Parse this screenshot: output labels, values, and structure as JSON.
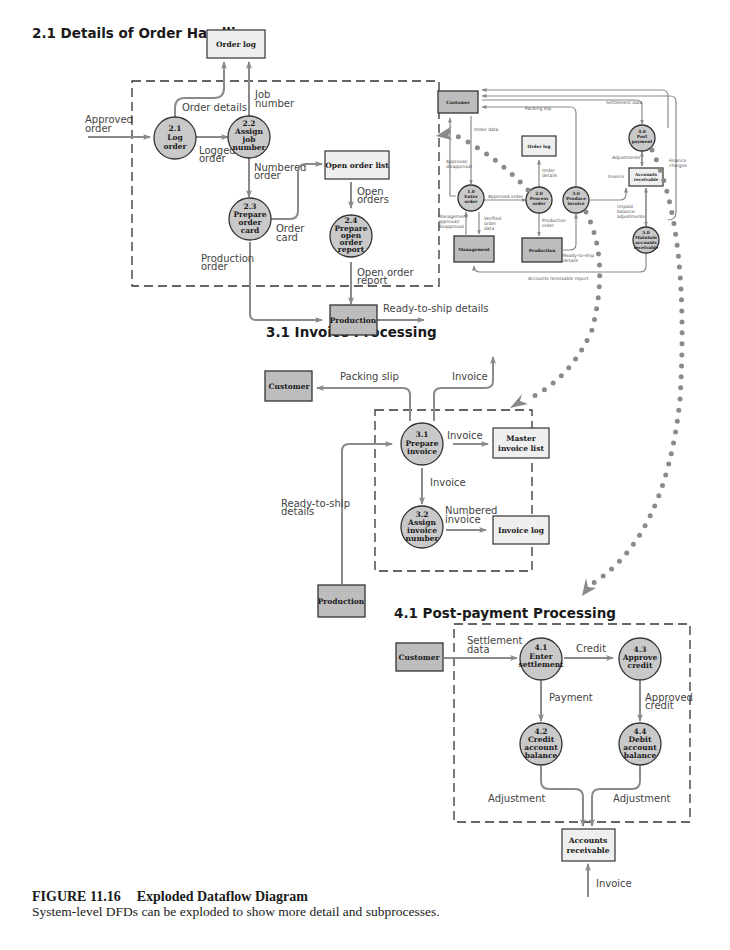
{
  "colors": {
    "process_fill": "#c9c9c9",
    "entity_fill": "#bdbdbd",
    "store_fill": "#efefef",
    "arrow": "#8a8a8a",
    "dots": "#8a8a8a",
    "text": "#1a1a1a"
  },
  "sections": {
    "order_handling": {
      "title": "2.1 Details of Order Handling",
      "processes": [
        {
          "id": "2.1",
          "label": "Log order"
        },
        {
          "id": "2.2",
          "label": "Assign job number"
        },
        {
          "id": "2.3",
          "label": "Prepare order card"
        },
        {
          "id": "2.4",
          "label": "Prepare open order report"
        }
      ],
      "stores": [
        "Order log",
        "Open order list"
      ],
      "entities": [
        "Production"
      ],
      "flows": [
        "Approved order",
        "Order details",
        "Job number",
        "Logged order",
        "Numbered order",
        "Order card",
        "Open orders",
        "Production order",
        "Open order report",
        "Ready-to-ship details"
      ]
    },
    "context": {
      "processes": [
        {
          "id": "1.0",
          "label": "Enter order"
        },
        {
          "id": "2.0",
          "label": "Process order"
        },
        {
          "id": "3.0",
          "label": "Produce invoice"
        },
        {
          "id": "4.0",
          "label": "Post payment"
        },
        {
          "id": "5.0",
          "label": "Maintain accounts receivable"
        }
      ],
      "entities": [
        "Customer",
        "Management",
        "Production"
      ],
      "stores": [
        "Order log",
        "Accounts receivable"
      ],
      "flows": [
        "Packing slip",
        "Settlement data",
        "Order data",
        "Approval/ disapproval",
        "Approved order",
        "Order details",
        "Management approval/ disapproval",
        "Verified order data",
        "Production order",
        "Ready-to-ship details",
        "Accounts receivable report",
        "Adjustments",
        "Invoice",
        "Unpaid balance adjustments",
        "Finance charges"
      ]
    },
    "invoice_processing": {
      "title": "3.1 Invoice Processing",
      "processes": [
        {
          "id": "3.1",
          "label": "Prepare invoice"
        },
        {
          "id": "3.2",
          "label": "Assign invoice number"
        }
      ],
      "stores": [
        "Master invoice list",
        "Invoice log"
      ],
      "entities": [
        "Customer",
        "Production"
      ],
      "flows": [
        "Packing slip",
        "Invoice",
        "Invoice",
        "Invoice",
        "Ready-to-ship details",
        "Numbered invoice"
      ]
    },
    "post_payment": {
      "title": "4.1 Post-payment Processing",
      "processes": [
        {
          "id": "4.1",
          "label": "Enter settlement"
        },
        {
          "id": "4.2",
          "label": "Credit account balance"
        },
        {
          "id": "4.3",
          "label": "Approve credit"
        },
        {
          "id": "4.4",
          "label": "Debit account balance"
        }
      ],
      "stores": [
        "Accounts receivable"
      ],
      "entities": [
        "Customer"
      ],
      "flows": [
        "Settlement data",
        "Credit",
        "Payment",
        "Approved credit",
        "Adjustment",
        "Adjustment",
        "Invoice"
      ]
    }
  },
  "caption": {
    "figure": "FIGURE 11.16",
    "title": "Exploded Dataflow Diagram",
    "text": "System-level DFDs can be exploded to show more detail and subprocesses."
  }
}
